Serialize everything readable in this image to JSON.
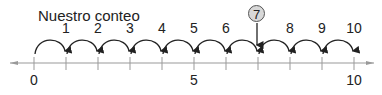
{
  "title": "Nuestro conteo",
  "marker": {
    "value": "7",
    "position": 7
  },
  "number_line": {
    "min": 0,
    "max": 10,
    "step": 1,
    "axis_labels": [
      "0",
      "5",
      "10"
    ],
    "axis_label_positions": [
      0,
      5,
      10
    ]
  },
  "jump_labels": [
    "1",
    "2",
    "3",
    "4",
    "5",
    "6",
    "",
    "8",
    "9",
    "10"
  ],
  "colors": {
    "line": "#999999",
    "arrow": "#222222",
    "marker_fill": "#d8d8d8"
  }
}
